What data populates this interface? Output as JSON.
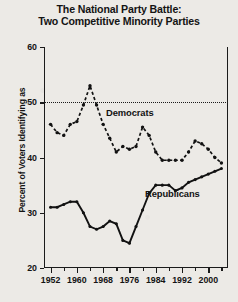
{
  "title": {
    "line1": "The National Party Battle:",
    "line2": "Two Competitive Minority Parties"
  },
  "axes": {
    "ylabel": "Percent of Voters Identifying as",
    "xlabel": "",
    "yticks": [
      20,
      30,
      40,
      50,
      60
    ],
    "xticks_major": [
      1952,
      1960,
      1968,
      1976,
      1984,
      1992,
      2000
    ],
    "xticks_minor": [
      1956,
      1964,
      1972,
      1980,
      1988,
      1996,
      2004
    ]
  },
  "annotations": {
    "democrats_label": "Democrats",
    "republicans_label": "Republicans",
    "reference_line_value": 50
  },
  "chart_data": {
    "type": "line",
    "title": "The National Party Battle: Two Competitive Minority Parties",
    "xlabel": "",
    "ylabel": "Percent of Voters Identifying as",
    "xlim": [
      1950,
      2006
    ],
    "ylim": [
      20,
      60
    ],
    "grid": false,
    "legend": "inline-annotation",
    "reference_lines": [
      {
        "axis": "y",
        "value": 50,
        "style": "dotted"
      }
    ],
    "x": [
      1952,
      1954,
      1956,
      1958,
      1960,
      1962,
      1964,
      1966,
      1968,
      1970,
      1972,
      1974,
      1976,
      1978,
      1980,
      1982,
      1984,
      1986,
      1988,
      1990,
      1992,
      1994,
      1996,
      1998,
      2000,
      2002,
      2004
    ],
    "series": [
      {
        "name": "Democrats",
        "style": "dashed",
        "marker": "dot",
        "values": [
          46.0,
          44.5,
          44.0,
          46.0,
          46.5,
          49.5,
          53.0,
          49.5,
          46.0,
          43.5,
          41.0,
          42.0,
          41.5,
          42.0,
          45.5,
          44.0,
          41.0,
          39.5,
          39.5,
          39.5,
          39.5,
          41.0,
          43.0,
          42.5,
          41.5,
          40.0,
          39.0
        ]
      },
      {
        "name": "Republicans",
        "style": "solid",
        "marker": "dot",
        "values": [
          31.0,
          31.0,
          31.5,
          32.0,
          32.0,
          30.0,
          27.5,
          27.0,
          27.5,
          28.5,
          28.0,
          25.0,
          24.5,
          27.5,
          30.5,
          33.5,
          35.0,
          35.0,
          35.0,
          34.0,
          34.5,
          35.5,
          36.0,
          36.5,
          37.0,
          37.5,
          38.0
        ]
      }
    ]
  }
}
